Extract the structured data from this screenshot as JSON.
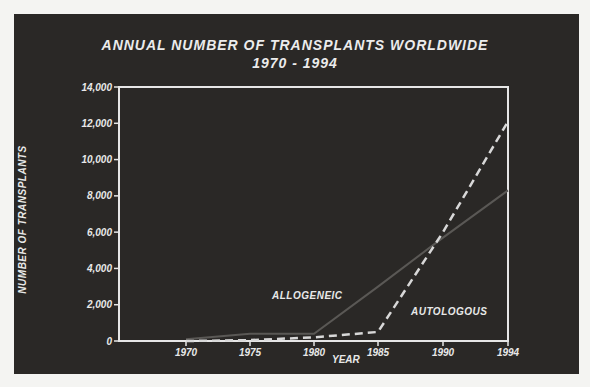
{
  "chart_data": {
    "type": "line",
    "title": "ANNUAL NUMBER OF TRANSPLANTS WORLDWIDE",
    "subtitle": "1970 - 1994",
    "xlabel": "YEAR",
    "ylabel": "NUMBER OF TRANSPLANTS",
    "x": [
      1970,
      1975,
      1980,
      1985,
      1990,
      1994
    ],
    "x_tick_labels": [
      "1970",
      "1975",
      "1980",
      "1985",
      "1990",
      "1994"
    ],
    "y_tick_labels": [
      "0",
      "2,000",
      "4,000",
      "6,000",
      "8,000",
      "10,000",
      "12,000",
      "14,000"
    ],
    "ylim": [
      0,
      14000
    ],
    "grid": false,
    "series": [
      {
        "name": "ALLOGENEIC",
        "style": "solid",
        "values": [
          100,
          400,
          400,
          3000,
          5700,
          8300
        ]
      },
      {
        "name": "AUTOLOGOUS",
        "style": "dashed",
        "values": [
          0,
          50,
          200,
          500,
          6000,
          12100
        ]
      }
    ]
  },
  "labels": {
    "allogeneic": "ALLOGENEIC",
    "autologous": "AUTOLOGOUS"
  }
}
